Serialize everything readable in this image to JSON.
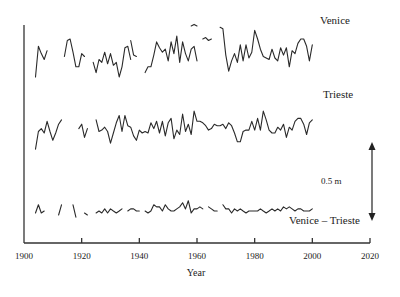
{
  "chart_data": {
    "type": "line",
    "title": "",
    "xlabel": "Year",
    "ylabel": "",
    "xlim": [
      1900,
      2020
    ],
    "x_ticks": [
      1900,
      1920,
      1940,
      1960,
      1980,
      2000,
      2020
    ],
    "y_axis_ticks": "none",
    "grid": false,
    "legend": "inline labels at right",
    "scale_bar": {
      "label": "0.5 m",
      "value_m": 0.5
    },
    "series": [
      {
        "name": "Venice",
        "label": "Venice",
        "unit": "m (relative, offset for display)",
        "segments": [
          {
            "x": [
              1904,
              1905,
              1906,
              1907,
              1908
            ],
            "values": [
              -0.13,
              0.08,
              0.03,
              -0.01,
              0.05
            ]
          },
          {
            "x": [
              1914,
              1915,
              1916,
              1917,
              1918,
              1919,
              1920,
              1921
            ],
            "values": [
              0.01,
              0.12,
              0.13,
              0.04,
              -0.06,
              -0.06,
              0.03,
              0.01
            ]
          },
          {
            "x": [
              1924,
              1925,
              1926,
              1927,
              1928,
              1929,
              1930,
              1931,
              1932,
              1933,
              1934,
              1935,
              1936,
              1937
            ],
            "values": [
              -0.03,
              -0.1,
              -0.01,
              -0.03,
              0.04,
              -0.04,
              0.03,
              -0.05,
              -0.03,
              -0.13,
              -0.06,
              0.07,
              0.08,
              -0.01
            ]
          },
          {
            "x": [
              1937,
              1938,
              1939
            ],
            "values": [
              0.12,
              0.02,
              0.01
            ]
          },
          {
            "x": [
              1942,
              1943,
              1944,
              1945,
              1946,
              1947,
              1948,
              1949,
              1950,
              1951,
              1952,
              1953,
              1954,
              1955,
              1956,
              1957,
              1958,
              1959,
              1960
            ],
            "values": [
              -0.1,
              -0.06,
              -0.06,
              0.02,
              0.11,
              0.07,
              0.04,
              0.06,
              -0.02,
              0.11,
              0.03,
              0.15,
              -0.03,
              0.11,
              0.03,
              -0.02,
              0.06,
              0.08,
              -0.02
            ]
          },
          {
            "x": [
              1958,
              1959,
              1960
            ],
            "values": [
              0.22,
              0.23,
              0.22
            ]
          },
          {
            "x": [
              1962,
              1963,
              1964,
              1965
            ],
            "values": [
              0.13,
              0.14,
              0.12,
              0.13
            ]
          },
          {
            "x": [
              1968,
              1969,
              1970,
              1971,
              1972,
              1973,
              1974,
              1975,
              1976,
              1977,
              1978,
              1979,
              1980,
              1981,
              1982,
              1983,
              1984,
              1985,
              1986,
              1987,
              1988,
              1989,
              1990,
              1991,
              1992,
              1993,
              1994,
              1995,
              1996,
              1997,
              1998,
              1999,
              2000
            ],
            "values": [
              0.21,
              0.2,
              0.02,
              -0.09,
              -0.02,
              0.03,
              -0.03,
              0.09,
              -0.02,
              0.09,
              0.0,
              0.04,
              0.19,
              0.13,
              0.06,
              0.01,
              0.0,
              -0.01,
              0.06,
              0.0,
              -0.02,
              0.07,
              0.02,
              0.07,
              -0.06,
              0.05,
              0.03,
              0.1,
              0.13,
              0.13,
              0.08,
              -0.02,
              0.09
            ]
          }
        ]
      },
      {
        "name": "Trieste",
        "label": "Trieste",
        "unit": "m (relative, offset for display)",
        "segments": [
          {
            "x": [
              1904,
              1905,
              1906,
              1907,
              1908,
              1909,
              1910,
              1911,
              1912,
              1913
            ],
            "values": [
              -0.11,
              0.01,
              0.03,
              0.0,
              0.08,
              0.01,
              -0.05,
              0.0,
              0.06,
              0.09
            ]
          },
          {
            "x": [
              1919,
              1920,
              1921,
              1922
            ],
            "values": [
              0.03,
              0.06,
              -0.03,
              0.03
            ]
          },
          {
            "x": [
              1925,
              1926,
              1927,
              1928,
              1929,
              1930,
              1931,
              1932,
              1933,
              1934,
              1935,
              1936,
              1937,
              1938,
              1939,
              1940,
              1941,
              1942,
              1943,
              1944,
              1945,
              1946,
              1947,
              1948,
              1949,
              1950,
              1951,
              1952,
              1953,
              1954,
              1955,
              1956,
              1957,
              1958,
              1959,
              1960,
              1961,
              1962,
              1963,
              1964,
              1965,
              1966,
              1967,
              1968,
              1969,
              1970,
              1971,
              1972,
              1973,
              1974,
              1975,
              1976,
              1977,
              1978,
              1979,
              1980,
              1981,
              1982,
              1983,
              1984,
              1985,
              1986,
              1987,
              1988,
              1989,
              1990,
              1991,
              1992,
              1993,
              1994,
              1995,
              1996,
              1997,
              1998,
              1999,
              2000
            ],
            "values": [
              0.09,
              0.01,
              0.02,
              0.04,
              0.01,
              -0.07,
              0.0,
              0.07,
              0.12,
              0.01,
              0.12,
              0.05,
              0.04,
              -0.02,
              -0.05,
              0.02,
              0.0,
              0.01,
              0.0,
              0.07,
              0.03,
              0.08,
              0.0,
              0.08,
              -0.02,
              0.07,
              0.1,
              -0.04,
              0.02,
              -0.01,
              0.13,
              0.01,
              0.06,
              -0.01,
              0.15,
              0.08,
              0.08,
              0.07,
              0.05,
              0.02,
              0.03,
              0.06,
              0.05,
              0.05,
              0.06,
              0.03,
              0.07,
              0.05,
              0.0,
              -0.06,
              -0.06,
              0.01,
              0.02,
              0.02,
              0.08,
              0.02,
              0.1,
              0.02,
              0.15,
              0.09,
              0.02,
              0.0,
              0.0,
              0.04,
              0.02,
              0.06,
              -0.03,
              0.04,
              0.02,
              0.08,
              0.1,
              0.1,
              0.06,
              -0.01,
              0.07,
              0.09
            ]
          }
        ]
      },
      {
        "name": "Venice – Trieste",
        "label": "Venice – Trieste",
        "unit": "m (difference, offset for display)",
        "segments": [
          {
            "x": [
              1904,
              1905,
              1906,
              1907
            ],
            "values": [
              0.0,
              0.04,
              0.0,
              0.01
            ]
          },
          {
            "x": [
              1912,
              1913
            ],
            "values": [
              -0.01,
              0.04
            ]
          },
          {
            "x": [
              1917,
              1918
            ],
            "values": [
              0.04,
              -0.02
            ]
          },
          {
            "x": [
              1921,
              1922
            ],
            "values": [
              0.0,
              -0.01
            ]
          },
          {
            "x": [
              1925,
              1926,
              1927,
              1928,
              1929,
              1930,
              1931,
              1932,
              1933,
              1934
            ],
            "values": [
              0.0,
              0.01,
              0.0,
              0.02,
              0.0,
              0.02,
              0.01,
              0.0,
              0.01,
              0.02
            ]
          },
          {
            "x": [
              1936,
              1937,
              1938,
              1939,
              1940
            ],
            "values": [
              0.01,
              0.02,
              0.02,
              0.01,
              0.01
            ]
          },
          {
            "x": [
              1942,
              1943,
              1944,
              1945,
              1946,
              1947,
              1948,
              1949,
              1950,
              1951,
              1952,
              1953,
              1954,
              1955,
              1956,
              1957,
              1958,
              1959,
              1960,
              1961,
              1962
            ],
            "values": [
              0.01,
              0.0,
              0.01,
              0.04,
              0.03,
              0.03,
              0.01,
              0.04,
              0.02,
              0.01,
              0.01,
              0.02,
              0.03,
              0.05,
              0.02,
              0.06,
              0.0,
              0.02,
              0.02,
              0.03,
              0.02
            ]
          },
          {
            "x": [
              1964,
              1965,
              1966,
              1967
            ],
            "values": [
              0.03,
              0.02,
              0.01,
              0.01
            ]
          },
          {
            "x": [
              1969,
              1970,
              1971,
              1972,
              1973,
              1974,
              1975,
              1976,
              1977,
              1978,
              1979,
              1980,
              1981,
              1982,
              1983,
              1984,
              1985,
              1986,
              1987,
              1988,
              1989,
              1990,
              1991,
              1992,
              1993,
              1994,
              1995,
              1996,
              1997,
              1998,
              1999,
              2000
            ],
            "values": [
              0.04,
              0.02,
              0.02,
              0.0,
              0.02,
              0.01,
              0.02,
              0.01,
              0.0,
              0.01,
              0.01,
              0.01,
              0.01,
              0.02,
              0.01,
              0.0,
              0.01,
              0.02,
              0.01,
              0.02,
              0.01,
              0.03,
              0.02,
              0.03,
              0.02,
              0.01,
              0.02,
              0.02,
              0.01,
              0.01,
              0.01,
              0.02
            ]
          }
        ]
      }
    ]
  },
  "labels": {
    "venice": "Venice",
    "trieste": "Trieste",
    "difference": "Venice – Trieste",
    "scale": "0.5 m",
    "xlabel": "Year",
    "ticks": [
      "1900",
      "1920",
      "1940",
      "1960",
      "1980",
      "2000",
      "2020"
    ]
  }
}
